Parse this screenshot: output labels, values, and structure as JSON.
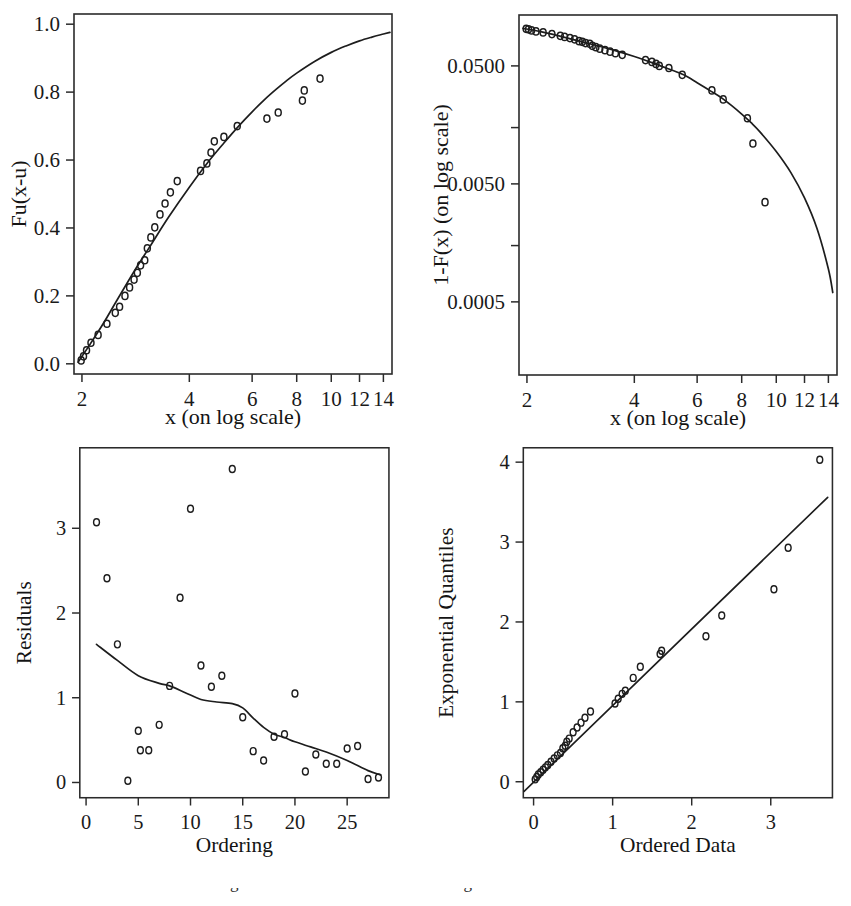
{
  "figure": {
    "background_color": "#ffffff",
    "ink_color": "#1d1d1d",
    "caption_partial": "Fitted generalized Pareto distribution diagnostics"
  },
  "panels": {
    "top_left": {
      "name": "distribution-fit-plot"
    },
    "top_right": {
      "name": "tail-survival-plot"
    },
    "bottom_left": {
      "name": "residuals-plot"
    },
    "bottom_right": {
      "name": "qq-plot"
    }
  },
  "chart_data": [
    {
      "id": "top_left",
      "type": "line",
      "title": "",
      "xlabel": "x (on log scale)",
      "ylabel": "Fu(x-u)",
      "xscale": "log",
      "yscale": "linear",
      "xlim": [
        1.9,
        14.8
      ],
      "ylim": [
        -0.03,
        1.03
      ],
      "xticks": [
        2,
        4,
        6,
        8,
        10,
        12,
        14
      ],
      "xticklabels": [
        "2",
        "4",
        "6",
        "8",
        "10",
        "12",
        "14"
      ],
      "yticks": [
        0.0,
        0.2,
        0.4,
        0.6,
        0.8,
        1.0
      ],
      "yticklabels": [
        "0.0",
        "0.2",
        "0.4",
        "0.6",
        "0.8",
        "1.0"
      ],
      "grid": false,
      "legend": "none",
      "series": [
        {
          "name": "empirical",
          "kind": "scatter",
          "marker": "open-circle",
          "x": [
            1.99,
            2.02,
            2.06,
            2.12,
            2.22,
            2.35,
            2.48,
            2.55,
            2.64,
            2.72,
            2.8,
            2.86,
            2.92,
            3.0,
            3.05,
            3.12,
            3.2,
            3.31,
            3.42,
            3.54,
            3.7,
            4.3,
            4.48,
            4.6,
            4.7,
            5.0,
            5.45,
            6.6,
            7.1,
            8.3,
            8.4,
            9.3
          ],
          "y": [
            0.01,
            0.022,
            0.04,
            0.062,
            0.085,
            0.118,
            0.15,
            0.168,
            0.2,
            0.225,
            0.248,
            0.268,
            0.29,
            0.305,
            0.34,
            0.372,
            0.402,
            0.44,
            0.472,
            0.505,
            0.538,
            0.568,
            0.59,
            0.622,
            0.655,
            0.668,
            0.7,
            0.722,
            0.74,
            0.775,
            0.805,
            0.84
          ]
        },
        {
          "name": "fitted-gpd",
          "kind": "line",
          "x": [
            1.95,
            2.1,
            2.3,
            2.5,
            2.8,
            3.1,
            3.5,
            4.0,
            4.5,
            5.0,
            5.5,
            6.0,
            6.5,
            7.0,
            7.5,
            8.0,
            9.0,
            10.0,
            11.0,
            12.0,
            13.0,
            14.0,
            14.6
          ],
          "y": [
            0.005,
            0.055,
            0.12,
            0.185,
            0.272,
            0.345,
            0.432,
            0.52,
            0.592,
            0.65,
            0.7,
            0.742,
            0.778,
            0.808,
            0.834,
            0.856,
            0.891,
            0.917,
            0.936,
            0.951,
            0.962,
            0.971,
            0.976
          ]
        }
      ]
    },
    {
      "id": "top_right",
      "type": "line",
      "title": "",
      "xlabel": "x (on log scale)",
      "ylabel": "1-F(x) (on log scale)",
      "xscale": "log",
      "yscale": "log",
      "xlim": [
        1.9,
        14.8
      ],
      "ylim": [
        0.00012,
        0.135
      ],
      "xticks": [
        2,
        4,
        6,
        8,
        10,
        12,
        14
      ],
      "xticklabels": [
        "2",
        "4",
        "6",
        "8",
        "10",
        "12",
        "14"
      ],
      "yticks": [
        0.05,
        0.005,
        0.0005
      ],
      "yticklabels": [
        "0.0500",
        "0.0050",
        "0.0005"
      ],
      "yminorticks": [
        0.015,
        0.0015
      ],
      "grid": false,
      "legend": "none",
      "series": [
        {
          "name": "empirical-tail",
          "kind": "scatter",
          "marker": "open-circle",
          "x": [
            1.99,
            2.02,
            2.06,
            2.12,
            2.22,
            2.35,
            2.48,
            2.55,
            2.64,
            2.72,
            2.8,
            2.86,
            2.92,
            3.0,
            3.05,
            3.12,
            3.2,
            3.31,
            3.42,
            3.54,
            3.7,
            4.3,
            4.48,
            4.6,
            4.7,
            5.0,
            5.45,
            6.6,
            7.1,
            8.3,
            8.6,
            9.3
          ],
          "y": [
            0.103,
            0.102,
            0.1,
            0.098,
            0.096,
            0.093,
            0.09,
            0.088,
            0.086,
            0.084,
            0.081,
            0.08,
            0.078,
            0.077,
            0.074,
            0.072,
            0.07,
            0.068,
            0.066,
            0.064,
            0.062,
            0.056,
            0.054,
            0.052,
            0.05,
            0.048,
            0.042,
            0.031,
            0.026,
            0.018,
            0.011,
            0.0035
          ]
        },
        {
          "name": "fitted-tail",
          "kind": "line",
          "x": [
            1.95,
            2.2,
            2.6,
            3.0,
            3.5,
            4.0,
            4.5,
            5.0,
            5.5,
            6.0,
            6.5,
            7.0,
            7.5,
            8.0,
            8.5,
            9.0,
            10.0,
            11.0,
            12.0,
            13.0,
            14.0,
            14.4
          ],
          "y": [
            0.104,
            0.097,
            0.086,
            0.077,
            0.068,
            0.06,
            0.053,
            0.047,
            0.042,
            0.036,
            0.031,
            0.027,
            0.023,
            0.0195,
            0.0165,
            0.0138,
            0.0094,
            0.0062,
            0.0038,
            0.0021,
            0.00095,
            0.0006
          ]
        }
      ]
    },
    {
      "id": "bottom_left",
      "type": "scatter",
      "title": "",
      "xlabel": "Ordering",
      "ylabel": "Residuals",
      "xscale": "linear",
      "yscale": "linear",
      "xlim": [
        -0.6,
        29.0
      ],
      "ylim": [
        -0.18,
        3.95
      ],
      "xticks": [
        0,
        5,
        10,
        15,
        20,
        25
      ],
      "xticklabels": [
        "0",
        "5",
        "10",
        "15",
        "20",
        "25"
      ],
      "yticks": [
        0,
        1,
        2,
        3
      ],
      "yticklabels": [
        "0",
        "1",
        "2",
        "3"
      ],
      "grid": false,
      "legend": "none",
      "series": [
        {
          "name": "residuals",
          "kind": "scatter",
          "marker": "open-circle",
          "x": [
            1,
            2,
            3,
            4,
            5,
            5.2,
            6,
            7,
            8,
            9,
            10,
            11,
            12,
            13,
            14,
            15,
            16,
            17,
            18,
            19,
            20,
            21,
            22,
            23,
            24,
            25,
            26,
            27,
            28
          ],
          "y": [
            3.07,
            2.41,
            1.63,
            0.02,
            0.61,
            0.38,
            0.38,
            0.68,
            1.14,
            2.18,
            3.23,
            1.38,
            1.13,
            1.26,
            3.7,
            0.77,
            0.37,
            0.26,
            0.54,
            0.57,
            1.05,
            0.13,
            0.33,
            0.22,
            0.22,
            0.4,
            0.43,
            0.04,
            0.06
          ]
        },
        {
          "name": "lowess-smooth",
          "kind": "line",
          "x": [
            1.0,
            3.0,
            5.0,
            7.0,
            8.0,
            9.5,
            11.0,
            12.5,
            14.0,
            15.0,
            16.0,
            17.0,
            18.0,
            19.0,
            20.0,
            21.5,
            23.0,
            25.0,
            27.0,
            28.2
          ],
          "y": [
            1.63,
            1.44,
            1.26,
            1.17,
            1.14,
            1.06,
            0.98,
            0.95,
            0.93,
            0.88,
            0.76,
            0.65,
            0.57,
            0.53,
            0.48,
            0.42,
            0.36,
            0.26,
            0.14,
            0.09
          ]
        }
      ]
    },
    {
      "id": "bottom_right",
      "type": "scatter",
      "title": "",
      "xlabel": "Ordered Data",
      "ylabel": "Exponential Quantiles",
      "xscale": "linear",
      "yscale": "linear",
      "xlim": [
        -0.13,
        3.78
      ],
      "ylim": [
        -0.2,
        4.18
      ],
      "xticks": [
        0,
        1,
        2,
        3
      ],
      "xticklabels": [
        "0",
        "1",
        "2",
        "3"
      ],
      "yticks": [
        0,
        1,
        2,
        3,
        4
      ],
      "yticklabels": [
        "0",
        "1",
        "2",
        "3",
        "4"
      ],
      "grid": false,
      "legend": "none",
      "series": [
        {
          "name": "qq-points",
          "kind": "scatter",
          "marker": "open-circle",
          "x": [
            0.02,
            0.04,
            0.06,
            0.09,
            0.12,
            0.15,
            0.18,
            0.22,
            0.26,
            0.3,
            0.34,
            0.37,
            0.4,
            0.42,
            0.45,
            0.5,
            0.55,
            0.6,
            0.65,
            0.72,
            1.03,
            1.07,
            1.12,
            1.16,
            1.26,
            1.35,
            1.6,
            1.62,
            2.18,
            2.38,
            3.04,
            3.22,
            3.62
          ],
          "y": [
            0.03,
            0.06,
            0.09,
            0.12,
            0.15,
            0.18,
            0.21,
            0.25,
            0.29,
            0.33,
            0.36,
            0.42,
            0.45,
            0.5,
            0.54,
            0.62,
            0.68,
            0.74,
            0.8,
            0.88,
            0.98,
            1.04,
            1.1,
            1.14,
            1.3,
            1.44,
            1.6,
            1.64,
            1.82,
            2.08,
            2.41,
            2.93,
            4.03
          ]
        },
        {
          "name": "reference-line",
          "kind": "line",
          "x": [
            -0.12,
            3.72
          ],
          "y": [
            -0.12,
            3.56
          ]
        }
      ]
    }
  ]
}
